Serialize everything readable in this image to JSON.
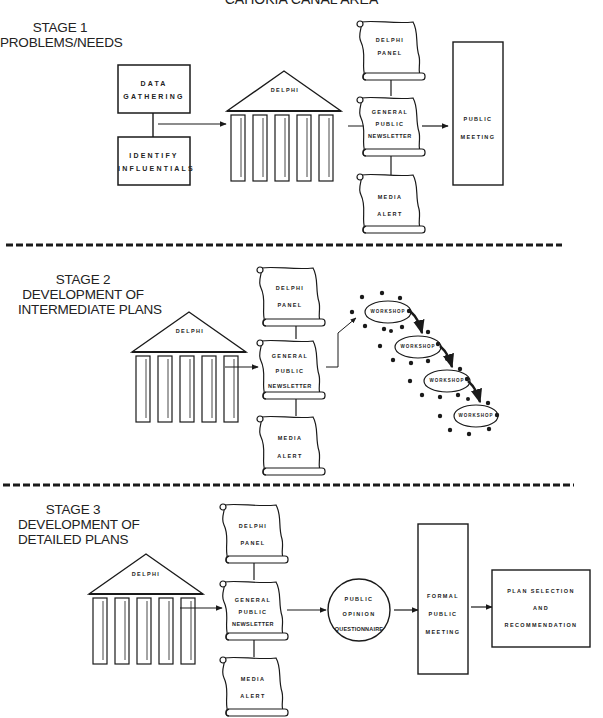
{
  "title": "CAHOKIA CANAL AREA",
  "stages": [
    {
      "id": "stage-1",
      "heading": [
        "STAGE 1",
        "PROBLEMS/NEEDS"
      ],
      "boxes": {
        "data_gathering": [
          "DATA",
          "GATHERING"
        ],
        "identify_influentials": [
          "IDENTIFY",
          "INFLUENTIALS"
        ]
      },
      "delphi": "DELPHI",
      "scrolls": {
        "delphi_panel": [
          "DELPHI",
          "PANEL"
        ],
        "newsletter": [
          "GENERAL",
          "PUBLIC",
          "NEWSLETTER"
        ],
        "media_alert": [
          "MEDIA",
          "ALERT"
        ]
      },
      "meeting": [
        "PUBLIC",
        "MEETING"
      ]
    },
    {
      "id": "stage-2",
      "heading": [
        "STAGE 2",
        "DEVELOPMENT OF",
        "INTERMEDIATE PLANS"
      ],
      "delphi": "DELPHI",
      "scrolls": {
        "delphi_panel": [
          "DELPHI",
          "PANEL"
        ],
        "newsletter": [
          "GENERAL",
          "PUBLIC",
          "NEWSLETTER"
        ],
        "media_alert": [
          "MEDIA",
          "ALERT"
        ]
      },
      "workshops": [
        "WORKSHOP",
        "WORKSHOP",
        "WORKSHOP",
        "WORKSHOP"
      ]
    },
    {
      "id": "stage-3",
      "heading": [
        "STAGE 3",
        "DEVELOPMENT OF",
        "DETAILED PLANS"
      ],
      "delphi": "DELPHI",
      "scrolls": {
        "delphi_panel": [
          "DELPHI",
          "PANEL"
        ],
        "newsletter": [
          "GENERAL",
          "PUBLIC",
          "NEWSLETTER"
        ],
        "media_alert": [
          "MEDIA",
          "ALERT"
        ]
      },
      "questionnaire": [
        "PUBLIC",
        "OPINION",
        "QUESTIONNAIRE"
      ],
      "meeting": [
        "FORMAL",
        "PUBLIC",
        "MEETING"
      ],
      "plan_selection": [
        "PLAN SELECTION",
        "AND",
        "RECOMMENDATION"
      ]
    }
  ],
  "colors": {
    "ink": "#1a1a1a",
    "background": "#ffffff"
  }
}
